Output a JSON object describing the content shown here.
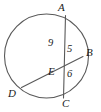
{
  "figure": {
    "type": "circle-with-intersecting-chords",
    "background_color": "#ffffff",
    "stroke_color": "#555555",
    "text_color": "#1a1a1a",
    "circle": {
      "cx": 46.5,
      "cy": 56,
      "r": 42
    },
    "points": {
      "A": {
        "label": "A",
        "x": 65,
        "y": 16
      },
      "B": {
        "label": "B",
        "x": 83,
        "y": 57
      },
      "C": {
        "label": "C",
        "x": 64,
        "y": 98
      },
      "D": {
        "label": "D",
        "x": 22,
        "y": 87
      },
      "E": {
        "label": "E",
        "x": 64,
        "y": 64
      }
    },
    "chords": [
      {
        "name": "chord-AC",
        "from": "A",
        "to": "C"
      },
      {
        "name": "chord-DB",
        "from": "D",
        "to": "B"
      }
    ],
    "segment_labels": {
      "AE": "9",
      "EB": "5",
      "EC": "6"
    }
  }
}
